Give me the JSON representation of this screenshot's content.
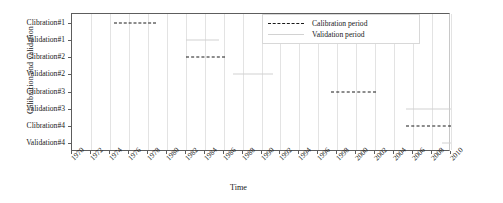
{
  "chart_data": {
    "type": "table",
    "title": "",
    "xlabel": "Time",
    "ylabel": "Calibration and validation",
    "xlim": [
      1970,
      2010
    ],
    "ylim_categories": [
      "Clibration#1",
      "Validation#1",
      "Clibration#2",
      "Validation#2",
      "Clibration#3",
      "Validation#3",
      "Clibration#4",
      "Validation#4"
    ],
    "xticks": [
      "1970",
      "1972",
      "1974",
      "1976",
      "1978",
      "1980",
      "1982",
      "1984",
      "1986",
      "1988",
      "1990",
      "1992",
      "1994",
      "1996",
      "1998",
      "2000",
      "2002",
      "2004",
      "2006",
      "2008",
      "2010"
    ],
    "xtick_values": [
      1970,
      1972,
      1974,
      1976,
      1978,
      1980,
      1982,
      1984,
      1986,
      1988,
      1990,
      1992,
      1994,
      1996,
      1998,
      2000,
      2002,
      2004,
      2006,
      2008,
      2010
    ],
    "grid": "vertical",
    "legend_position": "top-right",
    "legend": [
      {
        "label": "Calibration period",
        "style": "dashed",
        "color": "#1a1a1a"
      },
      {
        "label": "Validation period",
        "style": "solid",
        "color": "#d2d2d2"
      }
    ],
    "series": [
      {
        "name": "Clibration#1",
        "row": 0,
        "kind": "calibration",
        "start": 1974.4,
        "end": 1978.9
      },
      {
        "name": "Validation#1",
        "row": 1,
        "kind": "validation",
        "start": 1982.0,
        "end": 1985.5
      },
      {
        "name": "Clibration#2",
        "row": 2,
        "kind": "calibration",
        "start": 1982.0,
        "end": 1986.2
      },
      {
        "name": "Validation#2",
        "row": 3,
        "kind": "validation",
        "start": 1987.0,
        "end": 1991.2
      },
      {
        "name": "Clibration#3",
        "row": 4,
        "kind": "calibration",
        "start": 1997.3,
        "end": 2002.1
      },
      {
        "name": "Validation#3",
        "row": 5,
        "kind": "validation",
        "start": 2005.2,
        "end": 2010.0
      },
      {
        "name": "Clibration#4",
        "row": 6,
        "kind": "calibration",
        "start": 2005.2,
        "end": 2010.0
      },
      {
        "name": "Validation#4",
        "row": 7,
        "kind": "validation",
        "start": 2009.1,
        "end": 2010.0
      }
    ]
  },
  "axes": {
    "y_title": "Calibration and validation",
    "x_title": "Time"
  }
}
